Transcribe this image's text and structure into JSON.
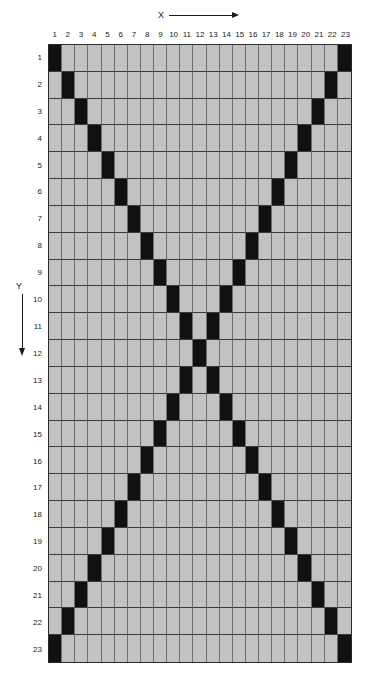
{
  "axes": {
    "x": {
      "label": "X",
      "arrow": "arrow-right",
      "direction": "right"
    },
    "y": {
      "label": "Y",
      "arrow": "arrow-down",
      "direction": "down"
    }
  },
  "grid": {
    "columns": 23,
    "rows": 23,
    "column_headers": [
      "1",
      "2",
      "3",
      "4",
      "5",
      "6",
      "7",
      "8",
      "9",
      "10",
      "11",
      "12",
      "13",
      "14",
      "15",
      "16",
      "17",
      "18",
      "19",
      "20",
      "21",
      "22",
      "23"
    ],
    "row_headers": [
      "1",
      "2",
      "3",
      "4",
      "5",
      "6",
      "7",
      "8",
      "9",
      "10",
      "11",
      "12",
      "13",
      "14",
      "15",
      "16",
      "17",
      "18",
      "19",
      "20",
      "21",
      "22",
      "23"
    ],
    "cell_on_color": "#111111",
    "cell_off_color": "#c2c2c2",
    "grid_line_color": "#3a3a3a",
    "border_color": "#2b2b2b",
    "pattern_name": "x-cross-diagonals",
    "filled_cells": [
      [
        1,
        23
      ],
      [
        2,
        22
      ],
      [
        3,
        21
      ],
      [
        4,
        20
      ],
      [
        5,
        19
      ],
      [
        6,
        18
      ],
      [
        7,
        17
      ],
      [
        8,
        16
      ],
      [
        9,
        15
      ],
      [
        10,
        14
      ],
      [
        11,
        13
      ],
      [
        12
      ],
      [
        11,
        13
      ],
      [
        10,
        14
      ],
      [
        9,
        15
      ],
      [
        8,
        16
      ],
      [
        7,
        17
      ],
      [
        6,
        18
      ],
      [
        5,
        19
      ],
      [
        4,
        20
      ],
      [
        3,
        21
      ],
      [
        2,
        22
      ],
      [
        1,
        23
      ]
    ]
  }
}
